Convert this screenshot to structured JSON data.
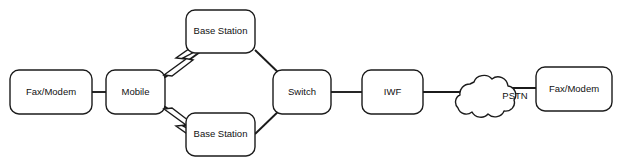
{
  "diagram": {
    "colors": {
      "stroke": "#1b1b1b",
      "fill": "#ffffff",
      "text": "#111111",
      "background": "#ffffff"
    },
    "nodes": {
      "fax_modem_left": {
        "label": "Fax/Modem",
        "shape": "rounded-rect"
      },
      "mobile": {
        "label": "Mobile",
        "shape": "rounded-rect"
      },
      "base_station_top": {
        "label": "Base Station",
        "shape": "rounded-rect"
      },
      "base_station_bottom": {
        "label": "Base Station",
        "shape": "rounded-rect"
      },
      "switch": {
        "label": "Switch",
        "shape": "rounded-rect"
      },
      "iwf": {
        "label": "IWF",
        "shape": "rounded-rect"
      },
      "pstn_cloud": {
        "label": "PSTN",
        "shape": "cloud"
      },
      "fax_modem_right": {
        "label": "Fax/Modem",
        "shape": "rounded-rect"
      }
    },
    "links": [
      {
        "from": "fax_modem_left",
        "to": "mobile",
        "type": "wired"
      },
      {
        "from": "mobile",
        "to": "base_station_top",
        "type": "wireless"
      },
      {
        "from": "mobile",
        "to": "base_station_bottom",
        "type": "wireless"
      },
      {
        "from": "base_station_top",
        "to": "switch",
        "type": "wired"
      },
      {
        "from": "base_station_bottom",
        "to": "switch",
        "type": "wired"
      },
      {
        "from": "switch",
        "to": "iwf",
        "type": "wired"
      },
      {
        "from": "iwf",
        "to": "pstn_cloud",
        "type": "wired"
      },
      {
        "from": "pstn_cloud",
        "to": "fax_modem_right",
        "type": "wired"
      }
    ],
    "icons": {
      "wireless_top": "lightning-bolt-icon",
      "wireless_bottom": "lightning-bolt-icon",
      "cloud": "cloud-icon"
    }
  }
}
